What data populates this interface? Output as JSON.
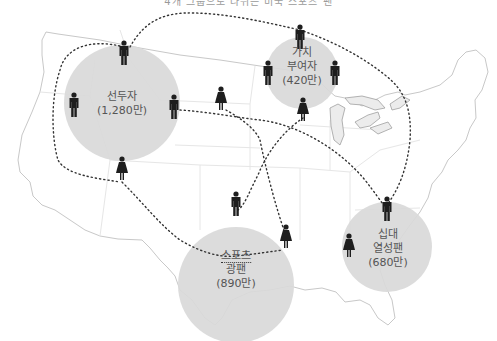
{
  "caption": "4개 그룹으로 나뉘는 미국 스포츠 팬",
  "colors": {
    "circle_fill": "#d9d9d9",
    "figure": "#1e1e1e",
    "map_stroke": "#c8c8c8",
    "lake_fill": "#ececec",
    "dotted_path": "#333333",
    "label_text": "#555555"
  },
  "segments": [
    {
      "id": "pioneers",
      "name": "선두자",
      "value": "(1,280만)",
      "cx": 122,
      "cy": 103,
      "r": 58
    },
    {
      "id": "value-adders",
      "name_line1": "가치",
      "name_line2": "부여자",
      "value": "(420만)",
      "cx": 302,
      "cy": 73,
      "r": 36
    },
    {
      "id": "sports-fans",
      "name_line1": "스포츠",
      "name_line2": "광팬",
      "value": "(890만)",
      "cx": 236,
      "cy": 285,
      "r": 58
    },
    {
      "id": "teen-fans",
      "name_line1": "십대",
      "name_line2": "열성팬",
      "value": "(680만)",
      "cx": 387,
      "cy": 247,
      "r": 45
    }
  ],
  "figures": [
    {
      "gender": "male",
      "x": 124,
      "y": 54
    },
    {
      "gender": "male",
      "x": 74,
      "y": 106
    },
    {
      "gender": "male",
      "x": 174,
      "y": 108
    },
    {
      "gender": "female",
      "x": 122,
      "y": 170
    },
    {
      "gender": "female",
      "x": 221,
      "y": 100
    },
    {
      "gender": "male",
      "x": 300,
      "y": 38
    },
    {
      "gender": "male",
      "x": 268,
      "y": 74
    },
    {
      "gender": "male",
      "x": 335,
      "y": 74
    },
    {
      "gender": "female",
      "x": 303,
      "y": 111
    },
    {
      "gender": "male",
      "x": 236,
      "y": 205
    },
    {
      "gender": "female",
      "x": 286,
      "y": 238
    },
    {
      "gender": "male",
      "x": 387,
      "y": 210
    },
    {
      "gender": "female",
      "x": 349,
      "y": 247
    }
  ]
}
